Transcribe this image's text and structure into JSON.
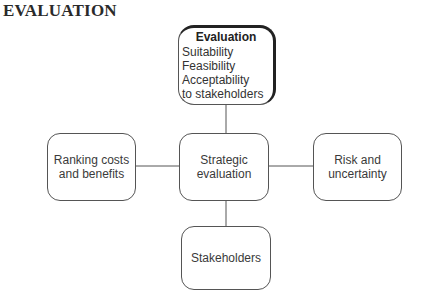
{
  "heading": "EVALUATION",
  "diagram": {
    "top_box": {
      "title": "Evaluation",
      "items": [
        "Suitability",
        "Feasibility",
        "Acceptability",
        "to stakeholders"
      ]
    },
    "center_box": {
      "lines": [
        "Strategic",
        "evaluation"
      ]
    },
    "left_box": {
      "lines": [
        "Ranking costs",
        "and benefits"
      ]
    },
    "right_box": {
      "lines": [
        "Risk and",
        "uncertainty"
      ]
    },
    "bottom_box": {
      "lines": [
        "Stakeholders"
      ]
    }
  },
  "colors": {
    "line": "#555555",
    "text": "#3a3a3a",
    "heading": "#2a2a2a"
  }
}
